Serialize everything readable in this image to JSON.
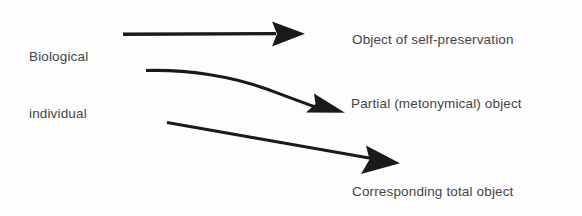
{
  "diagram": {
    "background_color": "#fdfdfd",
    "ink_color": "#1a1a1a",
    "text_color": "#454545",
    "source": {
      "line1": "Biological",
      "line2": "individual"
    },
    "targets": [
      {
        "id": "self-preservation",
        "label": "Object of self-preservation",
        "arrow": "straight-horizontal-arrow"
      },
      {
        "id": "partial-object",
        "label": "Partial (metonymical) object",
        "arrow": "curved-descending-arrow"
      },
      {
        "id": "total-object",
        "label": "Corresponding total object",
        "arrow": "straight-descending-arrow"
      }
    ],
    "arrows": [
      {
        "name": "arrow-to-self-preservation",
        "kind": "straight",
        "from": [
          123,
          34
        ],
        "to": [
          305,
          34
        ],
        "head": "solid-triangle"
      },
      {
        "name": "arrow-to-partial-object",
        "kind": "curved",
        "from": [
          146,
          70
        ],
        "control": [
          250,
          72
        ],
        "to": [
          343,
          110
        ],
        "head": "solid-triangle"
      },
      {
        "name": "arrow-to-total-object",
        "kind": "straight",
        "from": [
          167,
          122
        ],
        "to": [
          400,
          163
        ],
        "head": "solid-triangle"
      }
    ]
  }
}
